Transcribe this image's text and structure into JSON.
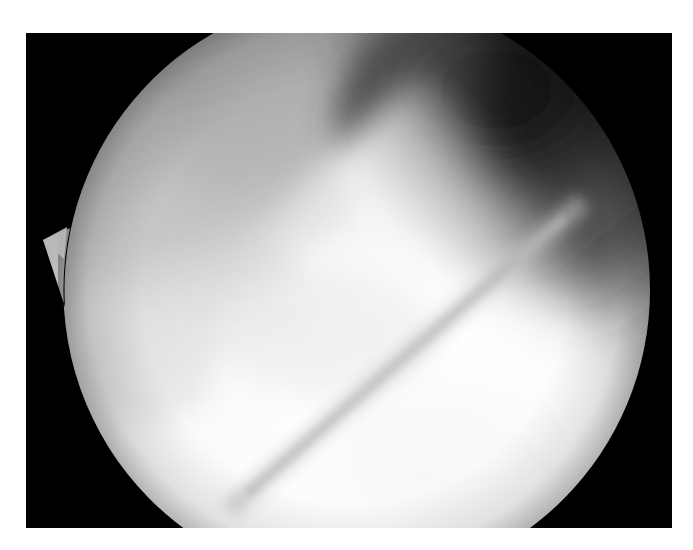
{
  "page": {
    "background_color": "#ffffff",
    "width": 693,
    "height": 550,
    "title": "Arthroscopic view of knee joint"
  },
  "figure": {
    "name": "arthroscopy-photograph",
    "frame": {
      "x": 26,
      "y": 33,
      "width": 646,
      "height": 495,
      "background_color": "#000000",
      "border_color": "#000000"
    },
    "modality": "arthroscopy",
    "color_mode": "grayscale",
    "field_of_view": {
      "shape": "circle",
      "center_x": 328,
      "center_y": 257,
      "radius": 296,
      "clipped_top": true,
      "clipped_bottom": true,
      "notch": {
        "present": true,
        "side": "left",
        "tip_x": 17,
        "tip_y": 207,
        "description": "triangular optical artifact spike on left rim"
      }
    },
    "tones": {
      "frame_black": "#000000",
      "shadow_darkest": "#1c1c1c",
      "shadow_mid": "#4a4a4a",
      "tissue_mid_gray": "#9a9a9a",
      "tissue_light_gray": "#c8c8c8",
      "tissue_bright": "#ececec",
      "highlight_white": "#fbfbfb",
      "groove_shade": "#c2c2c2"
    },
    "structures": [
      {
        "id": "dark-recess-upper-right",
        "label": "Dark intra-articular recess (upper right)",
        "tone": "#1c1c1c",
        "region": "upper-right quadrant"
      },
      {
        "id": "gray-wedge-upper-center",
        "label": "Mid-gray tissue wedge descending from top edge",
        "tone": "#8f8f8f",
        "region": "upper center"
      },
      {
        "id": "bright-diagonal-band",
        "label": "Bright illuminated cartilage band running upper-right to lower-left",
        "tone": "#f0f0f0",
        "region": "right to lower-left diagonal"
      },
      {
        "id": "bright-lower-field",
        "label": "Brightly lit lower tissue surface",
        "tone": "#f6f6f6",
        "region": "lower half"
      },
      {
        "id": "diagonal-groove",
        "label": "Faint diagonal groove / fold line",
        "tone": "#c6c6c6",
        "region": "lower center, running lower-left to upper-right"
      },
      {
        "id": "soft-shadow-left",
        "label": "Soft gray shading along left rim",
        "tone": "#adadad",
        "region": "left edge"
      }
    ]
  }
}
